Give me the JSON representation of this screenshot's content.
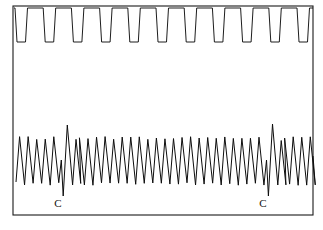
{
  "figure": {
    "background_color": "#ffffff",
    "ink_color": "#111111",
    "frame": {
      "x": 13,
      "y": 6,
      "width": 300,
      "height": 209,
      "stroke_color": "#1a1a1a",
      "stroke_width": 1.1
    },
    "annotations": [
      {
        "label": "C",
        "x": 58,
        "y": 207
      },
      {
        "label": "C",
        "x": 263,
        "y": 207
      }
    ]
  },
  "chart_data": {
    "type": "line",
    "subtitle": "Upper channel: square-wave marker pulses. Lower channel: sawtooth pulse trace with two marked 'C' events.",
    "xlabel": "",
    "ylabel": "",
    "grid": false,
    "legend": "none",
    "axis_visible": false,
    "xlim": [
      13,
      313
    ],
    "ylim": [
      6,
      215
    ],
    "y_axis_direction": "inverted-screen-coordinates",
    "series": [
      {
        "name": "marker-channel",
        "description": "Upper square-wave signal marker channel: flat baseline near top with regularly spaced rectangular downward deflections, each slightly slanted to the right.",
        "type": "square-wave",
        "baseline_y": 8,
        "pulse_bottom_y": 42,
        "pulse_count": 11,
        "pulse_period_px": 28.2,
        "pulse_width_px": 10.5,
        "pulse_slant_px": 2.0,
        "first_pulse_x": 15,
        "pulse_x_positions": [
          15,
          43.2,
          71.4,
          99.6,
          127.8,
          156,
          184.2,
          212.4,
          240.6,
          268.8,
          297
        ],
        "values_normalized": [
          1,
          0,
          1,
          0,
          1,
          0,
          1,
          0,
          1,
          0,
          1,
          0,
          1,
          0,
          1,
          0,
          1,
          0,
          1,
          0,
          1,
          0
        ]
      },
      {
        "name": "pulse-channel",
        "description": "Lower sawtooth pulse trace: rapid upstroke followed by slower downstroke, roughly 35 cycles; two 'C' events show a premature shallow beat, a deeper trough and a taller recovery peak.",
        "type": "sawtooth",
        "baseline_top_y": 140,
        "baseline_bottom_y": 184,
        "cycle_count": 35,
        "cycle_period_px": 8.55,
        "start_x": 16,
        "end_x": 313,
        "peak_y_typical": 138,
        "trough_y_typical": 184,
        "events": [
          {
            "name": "C-event-1",
            "label": "C",
            "cycle_index": 5,
            "premature_peak_y": 160,
            "deep_trough_y": 196,
            "recovery_peak_y": 125,
            "label_x": 58,
            "label_y": 207
          },
          {
            "name": "C-event-2",
            "label": "C",
            "cycle_index": 29,
            "premature_peak_y": 160,
            "deep_trough_y": 196,
            "recovery_peak_y": 124,
            "label_x": 263,
            "label_y": 207
          }
        ]
      }
    ]
  }
}
